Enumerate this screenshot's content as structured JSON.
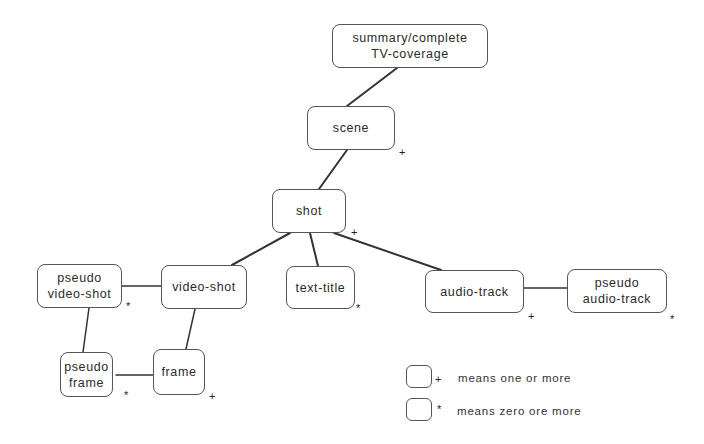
{
  "diagram": {
    "nodes": [
      {
        "id": "summary",
        "label": "summary/complete\nTV-coverage",
        "marker": ""
      },
      {
        "id": "scene",
        "label": "scene",
        "marker": "+"
      },
      {
        "id": "shot",
        "label": "shot",
        "marker": "+"
      },
      {
        "id": "pseudo-video-shot",
        "label": "pseudo\nvideo-shot",
        "marker": "*"
      },
      {
        "id": "video-shot",
        "label": "video-shot",
        "marker": ""
      },
      {
        "id": "text-title",
        "label": "text-title",
        "marker": "*"
      },
      {
        "id": "audio-track",
        "label": "audio-track",
        "marker": "+"
      },
      {
        "id": "pseudo-audio-track",
        "label": "pseudo\naudio-track",
        "marker": "*"
      },
      {
        "id": "pseudo-frame",
        "label": "pseudo\nframe",
        "marker": "*"
      },
      {
        "id": "frame",
        "label": "frame",
        "marker": "+"
      }
    ],
    "edges": [
      [
        "summary",
        "scene"
      ],
      [
        "scene",
        "shot"
      ],
      [
        "shot",
        "video-shot"
      ],
      [
        "shot",
        "text-title"
      ],
      [
        "shot",
        "audio-track"
      ],
      [
        "pseudo-video-shot",
        "video-shot"
      ],
      [
        "pseudo-video-shot",
        "pseudo-frame"
      ],
      [
        "video-shot",
        "frame"
      ],
      [
        "pseudo-frame",
        "frame"
      ],
      [
        "audio-track",
        "pseudo-audio-track"
      ]
    ]
  },
  "legend": {
    "items": [
      {
        "marker": "+",
        "text": "means one or more"
      },
      {
        "marker": "*",
        "text": "means zero ore more"
      }
    ]
  }
}
